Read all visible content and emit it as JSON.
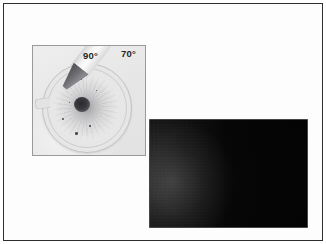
{
  "figure": {
    "background_color": "#ffffff",
    "frame_color": "#2e2e30"
  },
  "inset": {
    "name": "specimen-dish-inset",
    "background_color": "#e9e9e9",
    "border_color": "#9a9a9a",
    "labels": [
      {
        "id": "angle-90",
        "text": "90°"
      },
      {
        "id": "angle-70",
        "text": "70°"
      }
    ],
    "specimen": {
      "type": "circular-dish",
      "center_spot_color": "#2b2b2f",
      "dish_rim_color": "#c2c2c2"
    },
    "probe": {
      "type": "conical-probe",
      "body_color": "#f4f4f4",
      "tip_color": "#6c6c70"
    },
    "specks": [
      {
        "left": 47,
        "top": 32,
        "size": 2.2
      },
      {
        "left": 29,
        "top": 72,
        "size": 2.4
      },
      {
        "left": 42,
        "top": 86,
        "size": 2.6
      },
      {
        "left": 56,
        "top": 79,
        "size": 1.6
      },
      {
        "left": 63,
        "top": 44,
        "size": 1.4
      },
      {
        "left": 36,
        "top": 56,
        "size": 1.3
      }
    ]
  },
  "dark_panel": {
    "name": "dark-field-image",
    "background_color": "#050505",
    "haze_color": "#969698"
  }
}
